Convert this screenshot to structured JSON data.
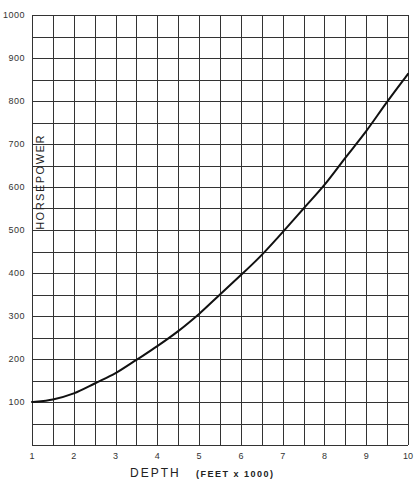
{
  "chart_data": {
    "type": "line",
    "title": "",
    "xlabel": "DEPTH",
    "xlabel_unit": "(FEET x 1000)",
    "ylabel": "HORSEPOWER",
    "xlim": [
      1,
      10
    ],
    "ylim": [
      0,
      1000
    ],
    "grid": true,
    "grid_x_step": 0.5,
    "grid_y_step": 50,
    "x_ticks": [
      1,
      2,
      3,
      4,
      5,
      6,
      7,
      8,
      9,
      10
    ],
    "x_tick_labels": [
      "1",
      "2",
      "3",
      "4",
      "5",
      "6",
      "7",
      "8",
      "9",
      "10"
    ],
    "y_ticks": [
      100,
      200,
      300,
      400,
      500,
      600,
      700,
      800,
      900,
      1000
    ],
    "y_tick_labels": [
      "100",
      "200",
      "300",
      "400",
      "500",
      "600",
      "700",
      "800",
      "900",
      "1000"
    ],
    "legend": null,
    "series": [
      {
        "name": "Horsepower vs Depth",
        "color": "#111111",
        "x": [
          1,
          1.5,
          2,
          2.5,
          3,
          3.5,
          4,
          4.5,
          5,
          5.5,
          6,
          6.5,
          7,
          7.5,
          8,
          8.5,
          9,
          9.5,
          10
        ],
        "values": [
          100,
          106,
          120,
          143,
          167,
          198,
          230,
          265,
          305,
          350,
          395,
          442,
          495,
          550,
          605,
          668,
          730,
          798,
          863
        ]
      }
    ]
  },
  "colors": {
    "background": "#ffffff",
    "grid": "#333333",
    "curve": "#111111",
    "text": "#222222"
  }
}
